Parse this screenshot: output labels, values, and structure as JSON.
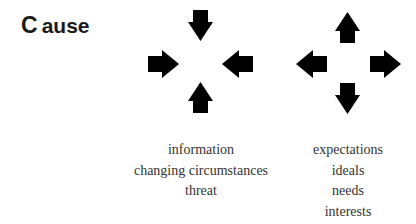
{
  "title": {
    "initial": "C",
    "rest": "ause"
  },
  "diagrams": {
    "inward": {
      "description": "four arrows pointing inward toward a center",
      "arrows": [
        {
          "direction": "down",
          "icon": "arrow-down-icon"
        },
        {
          "direction": "right",
          "icon": "arrow-right-icon"
        },
        {
          "direction": "left",
          "icon": "arrow-left-icon"
        },
        {
          "direction": "up",
          "icon": "arrow-up-icon"
        }
      ]
    },
    "outward": {
      "description": "four arrows pointing outward from a center",
      "arrows": [
        {
          "direction": "up",
          "icon": "arrow-up-icon"
        },
        {
          "direction": "left",
          "icon": "arrow-left-icon"
        },
        {
          "direction": "right",
          "icon": "arrow-right-icon"
        },
        {
          "direction": "down",
          "icon": "arrow-down-icon"
        }
      ]
    }
  },
  "lists": {
    "left": [
      "information",
      "changing circumstances",
      "threat"
    ],
    "right": [
      "expectations",
      "ideals",
      "needs",
      "interests"
    ]
  },
  "colors": {
    "arrow": "#000000",
    "title": "#1a1a1a",
    "body_text": "#333333"
  }
}
